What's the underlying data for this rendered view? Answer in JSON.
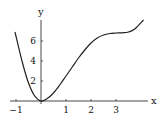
{
  "chart_data": {
    "type": "line",
    "title": "",
    "xlabel": "x",
    "ylabel": "y",
    "x_ticks": [
      -1,
      1,
      2,
      3
    ],
    "x_tick_labels": [
      "−1",
      "1",
      "2",
      "3"
    ],
    "y_ticks": [
      2,
      4,
      6
    ],
    "y_tick_labels": [
      "2",
      "4",
      "6"
    ],
    "xlim": [
      -1.1,
      4.3
    ],
    "ylim": [
      0,
      8.1
    ],
    "grid": false,
    "legend": null,
    "series": [
      {
        "name": "f(x)",
        "color": "#222222",
        "x": [
          -1.04,
          -0.75,
          -0.5,
          -0.25,
          0,
          0.25,
          0.5,
          0.75,
          1,
          1.25,
          1.5,
          1.75,
          2,
          2.25,
          2.5,
          2.75,
          3,
          3.25,
          3.5,
          3.75,
          4.1
        ],
        "y": [
          6.9,
          3.9,
          1.8,
          0.5,
          0,
          0.25,
          0.8,
          1.6,
          2.5,
          3.4,
          4.3,
          5.1,
          5.8,
          6.3,
          6.6,
          6.75,
          6.8,
          6.82,
          6.9,
          7.2,
          8.1
        ]
      }
    ]
  },
  "axes": {
    "x_label": "x",
    "y_label": "y"
  }
}
